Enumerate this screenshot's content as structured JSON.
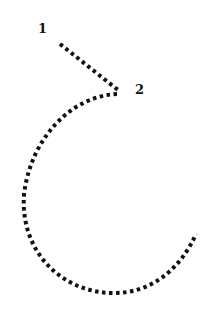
{
  "diagram": {
    "labels": [
      {
        "id": "1",
        "text": "1",
        "x": 38,
        "y": 22
      },
      {
        "id": "2",
        "text": "2",
        "x": 135,
        "y": 83
      }
    ],
    "colors": {
      "stroke": "#111111",
      "background": "#ffffff"
    },
    "segments": [
      {
        "from": "1",
        "to": "2",
        "style": "dotted",
        "shape": "straight"
      },
      {
        "from": "2",
        "to": "end",
        "style": "dotted",
        "shape": "arc"
      }
    ]
  }
}
